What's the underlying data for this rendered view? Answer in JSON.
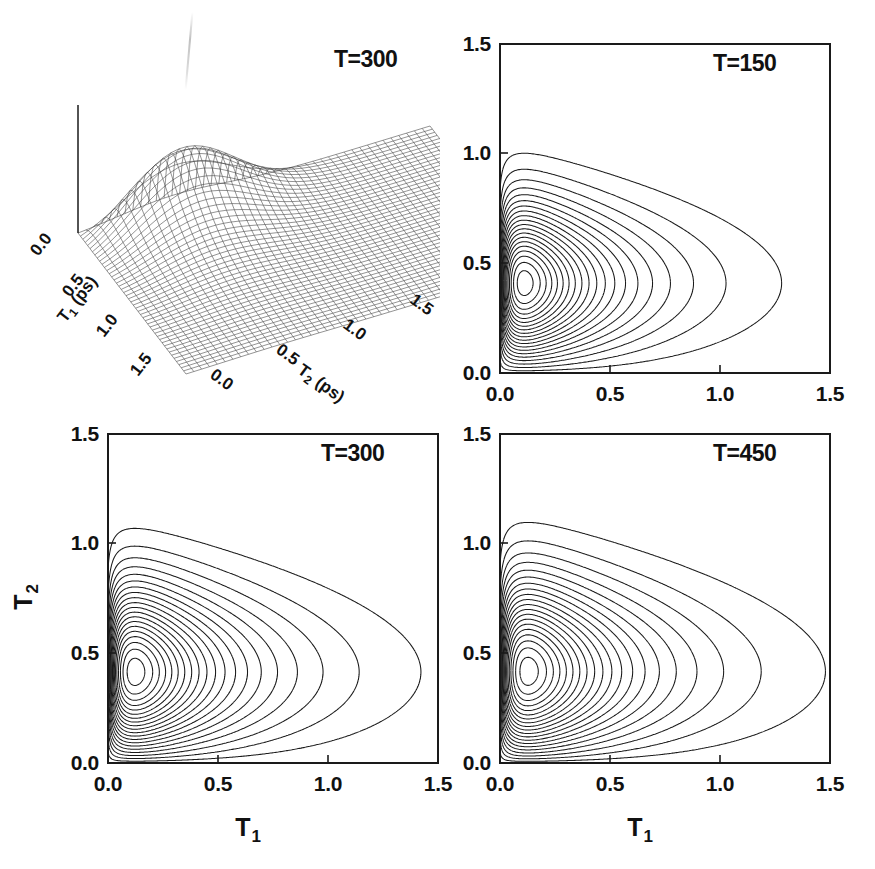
{
  "figure": {
    "background": "#ffffff",
    "line_color": "#1a1a1a",
    "mesh_color": "#3a3a3a"
  },
  "panels": [
    {
      "id": "panel-surface-t300",
      "kind": "surface3d",
      "label": "T=300",
      "x_axis": {
        "title": "T",
        "subscript": "1",
        "units": "(ps)",
        "ticks": [
          "0.0",
          "0.5",
          "1.0",
          "1.5"
        ]
      },
      "y_axis": {
        "title": "T",
        "subscript": "2",
        "units": "(ps)",
        "ticks": [
          "0.0",
          "0.5",
          "1.0",
          "1.5"
        ]
      }
    },
    {
      "id": "panel-contour-t150",
      "kind": "contour",
      "label": "T=150",
      "x_ticks": [
        "0.0",
        "0.5",
        "1.0",
        "1.5"
      ],
      "y_ticks": [
        "0.0",
        "0.5",
        "1.0",
        "1.5"
      ],
      "x_axis_title": "",
      "y_axis_title": ""
    },
    {
      "id": "panel-contour-t300",
      "kind": "contour",
      "label": "T=300",
      "x_ticks": [
        "0.0",
        "0.5",
        "1.0",
        "1.5"
      ],
      "y_ticks": [
        "0.0",
        "0.5",
        "1.0",
        "1.5"
      ],
      "x_axis_title": "T",
      "x_axis_subscript": "1",
      "y_axis_title": "T",
      "y_axis_subscript": "2"
    },
    {
      "id": "panel-contour-t450",
      "kind": "contour",
      "label": "T=450",
      "x_ticks": [
        "0.0",
        "0.5",
        "1.0",
        "1.5"
      ],
      "y_ticks": [
        "0.0",
        "0.5",
        "1.0",
        "1.5"
      ],
      "x_axis_title": "T",
      "x_axis_subscript": "1",
      "y_axis_title": "",
      "y_axis_subscript": ""
    }
  ],
  "chart_data": [
    {
      "type": "surface",
      "title": "T=300",
      "xlabel": "T_1 (ps)",
      "ylabel": "T_2 (ps)",
      "zlabel": "",
      "xlim": [
        0.0,
        1.5
      ],
      "ylim": [
        0.0,
        1.5
      ],
      "xticks": [
        0.0,
        0.5,
        1.0,
        1.5
      ],
      "yticks": [
        0.0,
        0.5,
        1.0,
        1.5
      ],
      "grid": false,
      "legend": "none",
      "description": "Wireframe mesh surface of a two-dimensional response function. A sharp ridge/peak rises near T1 = 0.10-0.20 and T2 = 0.35-0.45, decaying monotonically toward large T1 and large T2 to a near-flat plateau.",
      "peak": {
        "T1": 0.15,
        "T2": 0.4,
        "z_relative": 1.0
      },
      "mesh": {
        "n_x": 45,
        "n_y": 45
      },
      "surface_samples": {
        "T1": [
          0.0,
          0.1,
          0.2,
          0.3,
          0.4,
          0.5,
          0.75,
          1.0,
          1.25,
          1.5
        ],
        "T2": [
          0.0,
          0.1,
          0.2,
          0.3,
          0.4,
          0.5,
          0.75,
          1.0,
          1.25,
          1.5
        ],
        "z": [
          [
            0.0,
            0.06,
            0.12,
            0.16,
            0.18,
            0.17,
            0.12,
            0.07,
            0.04,
            0.02
          ],
          [
            0.0,
            0.28,
            0.62,
            0.88,
            0.97,
            0.92,
            0.58,
            0.31,
            0.15,
            0.07
          ],
          [
            0.0,
            0.26,
            0.6,
            0.86,
            0.95,
            0.9,
            0.57,
            0.3,
            0.15,
            0.07
          ],
          [
            0.0,
            0.2,
            0.45,
            0.64,
            0.71,
            0.68,
            0.44,
            0.24,
            0.12,
            0.06
          ],
          [
            0.0,
            0.14,
            0.31,
            0.44,
            0.5,
            0.48,
            0.32,
            0.18,
            0.09,
            0.04
          ],
          [
            0.0,
            0.09,
            0.21,
            0.3,
            0.34,
            0.33,
            0.23,
            0.13,
            0.07,
            0.03
          ],
          [
            0.0,
            0.04,
            0.08,
            0.12,
            0.14,
            0.14,
            0.1,
            0.06,
            0.03,
            0.02
          ],
          [
            0.0,
            0.01,
            0.03,
            0.05,
            0.06,
            0.06,
            0.04,
            0.03,
            0.02,
            0.01
          ],
          [
            0.0,
            0.01,
            0.01,
            0.02,
            0.02,
            0.02,
            0.02,
            0.01,
            0.01,
            0.0
          ],
          [
            0.0,
            0.0,
            0.0,
            0.01,
            0.01,
            0.01,
            0.01,
            0.0,
            0.0,
            0.0
          ]
        ]
      }
    },
    {
      "type": "contour",
      "title": "T=150",
      "xlabel": "",
      "ylabel": "",
      "xlim": [
        0.0,
        1.5
      ],
      "ylim": [
        0.0,
        1.5
      ],
      "xticks": [
        0.0,
        0.5,
        1.0,
        1.5
      ],
      "yticks": [
        0.0,
        0.5,
        1.0,
        1.5
      ],
      "grid": false,
      "legend": "none",
      "n_levels": 20,
      "peak": {
        "T1": 0.02,
        "T2": 0.4
      },
      "outermost_contour": {
        "max_T1": 0.53,
        "top_T2": 1.15,
        "bottom_T2": 0.11
      },
      "description": "Nested open contour loops anchored on the T1 = 0 axis, peak centred near T2 = 0.40, outermost level reaching T1 = 0.53."
    },
    {
      "type": "contour",
      "title": "T=300",
      "xlabel": "T_1",
      "ylabel": "T_2",
      "xlim": [
        0.0,
        1.5
      ],
      "ylim": [
        0.0,
        1.5
      ],
      "xticks": [
        0.0,
        0.5,
        1.0,
        1.5
      ],
      "yticks": [
        0.0,
        0.5,
        1.0,
        1.5
      ],
      "grid": false,
      "legend": "none",
      "n_levels": 20,
      "peak": {
        "T1": 0.02,
        "T2": 0.4
      },
      "outermost_contour": {
        "max_T1": 0.58,
        "top_T2": 1.3,
        "bottom_T2": 0.1
      },
      "description": "Same nested contour family as T=150 but broader; outermost level reaches T1 = 0.58 and extends up to T2 = 1.30."
    },
    {
      "type": "contour",
      "title": "T=450",
      "xlabel": "T_1",
      "ylabel": "",
      "xlim": [
        0.0,
        1.5
      ],
      "ylim": [
        0.0,
        1.5
      ],
      "xticks": [
        0.0,
        0.5,
        1.0,
        1.5
      ],
      "yticks": [
        0.0,
        0.5,
        1.0,
        1.5
      ],
      "grid": false,
      "legend": "none",
      "n_levels": 20,
      "peak": {
        "T1": 0.02,
        "T2": 0.4
      },
      "outermost_contour": {
        "max_T1": 0.57,
        "top_T2": 1.37,
        "bottom_T2": 0.1
      },
      "description": "Broadest of the three contour panels; outermost level reaches T1 = 0.57 and tops out near T2 = 1.37."
    }
  ]
}
